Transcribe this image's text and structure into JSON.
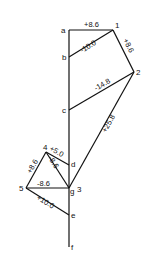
{
  "diagram": {
    "type": "force-polygon (Bow's notation)",
    "points": {
      "a": {
        "label": "a"
      },
      "b": {
        "label": "b"
      },
      "c": {
        "label": "c"
      },
      "d": {
        "label": "d"
      },
      "e": {
        "label": "e"
      },
      "f": {
        "label": "f"
      },
      "g": {
        "label": "g"
      },
      "n1": {
        "label": "1"
      },
      "n2": {
        "label": "2"
      },
      "n3": {
        "label": "3"
      },
      "n4": {
        "label": "4"
      },
      "n5": {
        "label": "5"
      }
    },
    "members": [
      {
        "from": "a",
        "to": "1",
        "value": "+8.6"
      },
      {
        "from": "b",
        "to": "1",
        "value": "-10.0"
      },
      {
        "from": "1",
        "to": "2",
        "value": "+8.6"
      },
      {
        "from": "c",
        "to": "2",
        "value": "-14.8"
      },
      {
        "from": "2",
        "to": "3",
        "value": "+25.8"
      },
      {
        "from": "4",
        "to": "d",
        "value": "+5.0"
      },
      {
        "from": "4",
        "to": "3",
        "value": "-8.6"
      },
      {
        "from": "5",
        "to": "4",
        "value": "+8.6"
      },
      {
        "from": "5",
        "to": "3",
        "value": "-8.6"
      },
      {
        "from": "5",
        "to": "e",
        "value": "+10.0"
      }
    ]
  }
}
